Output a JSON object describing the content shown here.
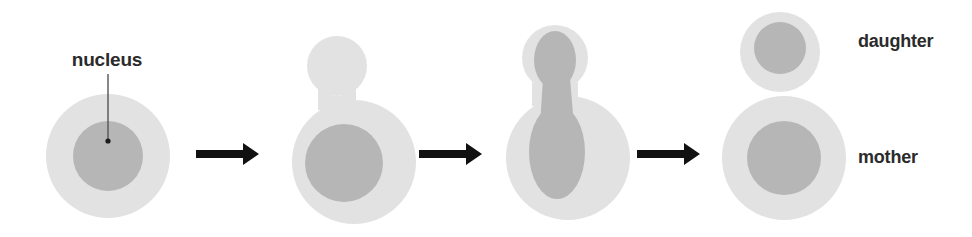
{
  "figure": {
    "background_color": "#ffffff",
    "width": 972,
    "height": 237
  },
  "colors": {
    "cytoplasm": "#e2e2e2",
    "nucleus": "#b6b6b6",
    "arrow": "#111111",
    "text": "#2b2b2b",
    "leader_line": "#555555",
    "background": "#ffffff"
  },
  "labels": {
    "nucleus": "nucleus",
    "daughter": "daughter",
    "mother": "mother"
  },
  "stages": [
    {
      "name": "stage-1-unbudded-cell",
      "description": "single round mother cell with central nucleus"
    },
    {
      "name": "stage-2-bud-emergence",
      "description": "small bud emerges at top of mother cell, nucleus remains in mother"
    },
    {
      "name": "stage-3-nuclear-division",
      "description": "nucleus elongates through the neck into hourglass shape spanning mother and bud"
    },
    {
      "name": "stage-4-separation",
      "description": "daughter cell with its own nucleus separates from the mother cell"
    }
  ],
  "arrows": [
    {
      "name": "arrow-stage-1-to-2"
    },
    {
      "name": "arrow-stage-2-to-3"
    },
    {
      "name": "arrow-stage-3-to-4"
    }
  ]
}
